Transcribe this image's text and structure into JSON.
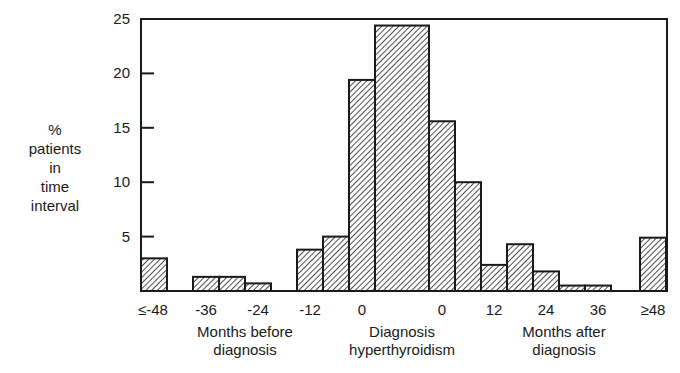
{
  "chart_data": {
    "type": "bar",
    "title": "",
    "ylabel": "% patients in time interval",
    "ylabel_lines": [
      "%",
      "patients",
      "in",
      "time",
      "interval"
    ],
    "xlabel": "",
    "ylim": [
      0,
      25
    ],
    "yticks": [
      5,
      10,
      15,
      20,
      25
    ],
    "xtick_labels": [
      "≤-48",
      "-36",
      "-24",
      "-12",
      "0",
      "0",
      "12",
      "24",
      "36",
      "≥48"
    ],
    "x_group_labels": [
      {
        "lines": [
          "Months before",
          "diagnosis"
        ]
      },
      {
        "lines": [
          "Diagnosis",
          "hyperthyroidism"
        ]
      },
      {
        "lines": [
          "Months after",
          "diagnosis"
        ]
      }
    ],
    "grid": false,
    "legend": null,
    "bar_fill": "diagonal-hatch",
    "bars": [
      {
        "interval": "≤-48",
        "value": 3.0
      },
      {
        "interval": "-42 to -36",
        "value": 1.3
      },
      {
        "interval": "-36 to -30",
        "value": 1.3
      },
      {
        "interval": "-30 to -24",
        "value": 0.7
      },
      {
        "interval": "-24 to -18",
        "value": 0
      },
      {
        "interval": "-18 to -12",
        "value": 3.8
      },
      {
        "interval": "-12 to -6",
        "value": 5.0
      },
      {
        "interval": "-6 to 0",
        "value": 19.4
      },
      {
        "interval": "Diagnosis (0)",
        "value": 24.4
      },
      {
        "interval": "0 to 6",
        "value": 15.6
      },
      {
        "interval": "6 to 12",
        "value": 10.0
      },
      {
        "interval": "12 to 18",
        "value": 2.4
      },
      {
        "interval": "18 to 24",
        "value": 4.3
      },
      {
        "interval": "24 to 30",
        "value": 1.8
      },
      {
        "interval": "30 to 36",
        "value": 0.5
      },
      {
        "interval": "36 to 42",
        "value": 0.5
      },
      {
        "interval": "42 to 48",
        "value": 0
      },
      {
        "interval": "≥48",
        "value": 4.9
      }
    ]
  },
  "layout": {
    "bar_x": [
      141,
      193,
      219,
      245,
      271,
      297,
      323,
      349,
      375,
      429,
      455,
      481,
      507,
      533,
      559,
      585,
      611,
      640
    ],
    "bar_w": [
      26,
      26,
      26,
      26,
      26,
      26,
      26,
      26,
      54,
      26,
      26,
      26,
      26,
      26,
      26,
      26,
      26,
      26
    ],
    "xtick_x": [
      153,
      206,
      258,
      310,
      362,
      442,
      494,
      546,
      598,
      653
    ]
  }
}
